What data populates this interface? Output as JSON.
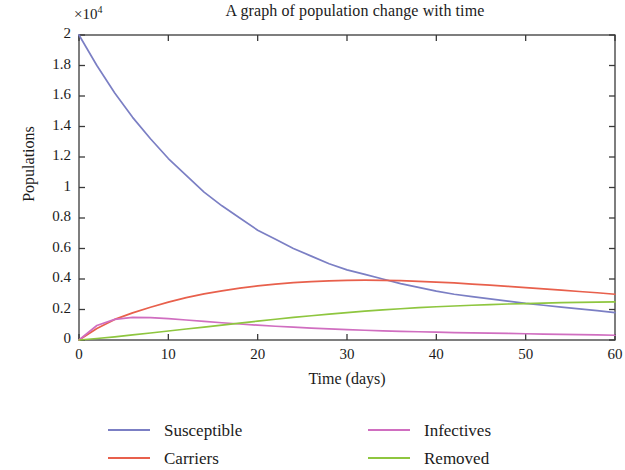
{
  "chart_data": {
    "type": "line",
    "title": "A graph of population change with time",
    "xlabel": "Time (days)",
    "ylabel": "Populations",
    "y_exponent_label": "×10",
    "y_exponent_power": "4",
    "y_scale_factor": 10000,
    "xlim": [
      0,
      60
    ],
    "ylim": [
      0,
      2
    ],
    "grid": false,
    "legend_position": "below-axes",
    "xticks": [
      0,
      10,
      20,
      30,
      40,
      50,
      60
    ],
    "xtick_labels": [
      "0",
      "10",
      "20",
      "30",
      "40",
      "50",
      "60"
    ],
    "yticks": [
      0,
      0.2,
      0.4,
      0.6,
      0.8,
      1,
      1.2,
      1.4,
      1.6,
      1.8,
      2
    ],
    "ytick_labels": [
      "0",
      "0.2",
      "0.4",
      "0.6",
      "0.8",
      "1",
      "1.2",
      "1.4",
      "1.6",
      "1.8",
      "2"
    ],
    "x": [
      0,
      2,
      4,
      6,
      8,
      10,
      12,
      14,
      16,
      18,
      20,
      22,
      24,
      26,
      28,
      30,
      32,
      34,
      36,
      38,
      40,
      42,
      44,
      46,
      48,
      50,
      52,
      54,
      56,
      58,
      60
    ],
    "series": [
      {
        "name": "Susceptible",
        "color": "#7b7fc4",
        "values": [
          2.0,
          1.8,
          1.62,
          1.46,
          1.32,
          1.19,
          1.08,
          0.97,
          0.88,
          0.8,
          0.72,
          0.66,
          0.6,
          0.55,
          0.5,
          0.46,
          0.43,
          0.4,
          0.37,
          0.345,
          0.32,
          0.3,
          0.285,
          0.27,
          0.255,
          0.24,
          0.228,
          0.216,
          0.204,
          0.192,
          0.18
        ]
      },
      {
        "name": "Carriers",
        "color": "#e8604c",
        "values": [
          0.0,
          0.075,
          0.135,
          0.178,
          0.215,
          0.248,
          0.278,
          0.302,
          0.322,
          0.34,
          0.355,
          0.367,
          0.376,
          0.383,
          0.388,
          0.391,
          0.392,
          0.391,
          0.389,
          0.385,
          0.38,
          0.374,
          0.367,
          0.36,
          0.352,
          0.344,
          0.335,
          0.327,
          0.318,
          0.31,
          0.3
        ]
      },
      {
        "name": "Infectives",
        "color": "#d06ec0",
        "values": [
          0.0,
          0.095,
          0.135,
          0.148,
          0.147,
          0.14,
          0.131,
          0.122,
          0.113,
          0.105,
          0.097,
          0.09,
          0.084,
          0.078,
          0.073,
          0.068,
          0.064,
          0.06,
          0.057,
          0.054,
          0.051,
          0.049,
          0.047,
          0.045,
          0.043,
          0.041,
          0.039,
          0.037,
          0.035,
          0.033,
          0.031
        ]
      },
      {
        "name": "Removed",
        "color": "#8ec63f",
        "values": [
          0.0,
          0.01,
          0.021,
          0.033,
          0.046,
          0.059,
          0.072,
          0.085,
          0.098,
          0.111,
          0.124,
          0.136,
          0.148,
          0.159,
          0.17,
          0.18,
          0.189,
          0.197,
          0.205,
          0.212,
          0.218,
          0.223,
          0.228,
          0.232,
          0.236,
          0.239,
          0.242,
          0.245,
          0.247,
          0.249,
          0.25
        ]
      }
    ],
    "legend": [
      {
        "label": "Susceptible",
        "color": "#7b7fc4"
      },
      {
        "label": "Carriers",
        "color": "#e8604c"
      },
      {
        "label": "Infectives",
        "color": "#d06ec0"
      },
      {
        "label": "Removed",
        "color": "#8ec63f"
      }
    ],
    "axis_color": "#3a3a3a"
  }
}
